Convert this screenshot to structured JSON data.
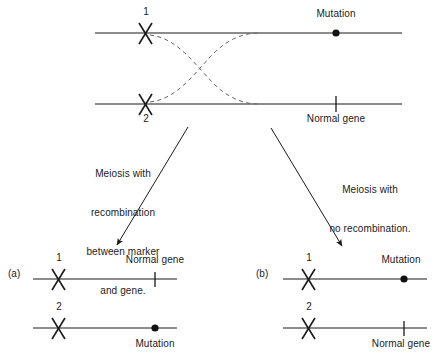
{
  "figure": {
    "background_color": "#ffffff",
    "line_color": "#1a1a1a",
    "dashed_color": "#555555"
  },
  "top_diagram": {
    "chromosome_1": {
      "marker_label": "1",
      "locus_label": "Mutation",
      "locus_symbol": "filled-dot"
    },
    "chromosome_2": {
      "marker_label": "2",
      "locus_label": "Normal gene",
      "locus_symbol": "tick"
    },
    "crossover_symbol": "dashed-crossing-lines"
  },
  "arrows": {
    "left": {
      "label_lines": [
        "Meiosis with",
        "recombination",
        "between marker",
        "and gene."
      ]
    },
    "right": {
      "label_lines": [
        "Meiosis with",
        "no recombination."
      ]
    }
  },
  "outcome_a": {
    "tag": "(a)",
    "rows": [
      {
        "marker_label": "1",
        "locus_label": "Normal gene",
        "locus_symbol": "tick",
        "label_position": "above"
      },
      {
        "marker_label": "2",
        "locus_label": "Mutation",
        "locus_symbol": "filled-dot",
        "label_position": "below"
      }
    ]
  },
  "outcome_b": {
    "tag": "(b)",
    "rows": [
      {
        "marker_label": "1",
        "locus_label": "Mutation",
        "locus_symbol": "filled-dot",
        "label_position": "above"
      },
      {
        "marker_label": "2",
        "locus_label": "Normal gene",
        "locus_symbol": "tick",
        "label_position": "below"
      }
    ]
  }
}
